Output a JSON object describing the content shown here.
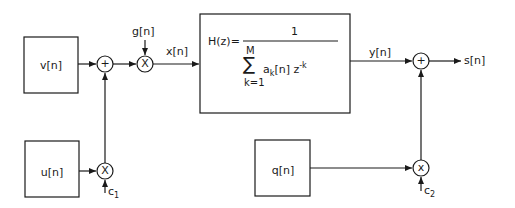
{
  "diagram": {
    "type": "signal-flow block diagram",
    "blocks": {
      "v": {
        "label": "v[n]"
      },
      "u": {
        "label": "u[n]"
      },
      "q": {
        "label": "q[n]"
      },
      "filter": {
        "lhs": "H(z)=",
        "numerator": "1",
        "sum_upper": "M",
        "sum_symbol": "∑",
        "sum_lower": "k=1",
        "term_a": "a",
        "term_a_sub": "k",
        "term_n": "[n] z",
        "term_exp": "-k"
      }
    },
    "operators": {
      "sum1": "+",
      "mult_g": "X",
      "mult_c1": "X",
      "sum2": "+",
      "mult_c2": "x"
    },
    "signals": {
      "g": "g[n]",
      "x": "x[n]",
      "y": "y[n]",
      "s": "s[n]",
      "c1": "c",
      "c1_sub": "1",
      "c2": "c",
      "c2_sub": "2"
    },
    "colors": {
      "ink": "#1a1a1a",
      "background": "#ffffff"
    }
  }
}
